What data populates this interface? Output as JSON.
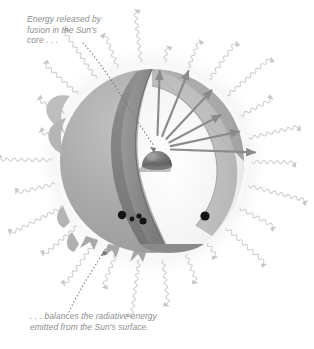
{
  "figure": {
    "background_color": "#ffffff"
  },
  "annotations": {
    "top": {
      "text": "Energy released by\nfusion in the Sun's\ncore . . .",
      "color": "#8e8e8e",
      "leader": "dotted-line-to-core"
    },
    "bottom": {
      "text": ". . . balances the radiative energy\nemitted from the Sun's surface.",
      "color": "#8e8e8e",
      "leader": "dotted-line-to-surface"
    }
  },
  "sun": {
    "label": "sun-sphere",
    "center_x": 152,
    "center_y": 161,
    "radius": 92,
    "surface_color": "#a9a9a9",
    "cutaway_label": "wedge-cutaway",
    "cut_face_color": "#8d8d8d",
    "interior_color": "#f2f2f2",
    "radiative_zone_color": "#bdbdbd",
    "core": {
      "label": "sun-core",
      "color": "#6f6f6f",
      "center_x": 157,
      "center_y": 153,
      "radius": 15
    },
    "arrows": {
      "label": "energy-arrows",
      "count": 6,
      "color": "#8a8a8a",
      "angles_deg": [
        -88,
        -68,
        -47,
        -28,
        -12,
        2
      ]
    },
    "sunspots": [
      {
        "x": 122,
        "y": 215,
        "r": 4.2
      },
      {
        "x": 132,
        "y": 219,
        "r": 2.4
      },
      {
        "x": 139,
        "y": 216,
        "r": 2.6
      },
      {
        "x": 143,
        "y": 221,
        "r": 3.6
      },
      {
        "x": 205,
        "y": 216,
        "r": 4.6
      }
    ],
    "prominences_label": "limb-prominences"
  },
  "radiation": {
    "label": "radiated-energy-waves",
    "color": "#cfcfcf",
    "arrow_color": "#c6c6c6",
    "count": 26,
    "description": "wavy arrows emitted radially from the Sun's surface"
  }
}
